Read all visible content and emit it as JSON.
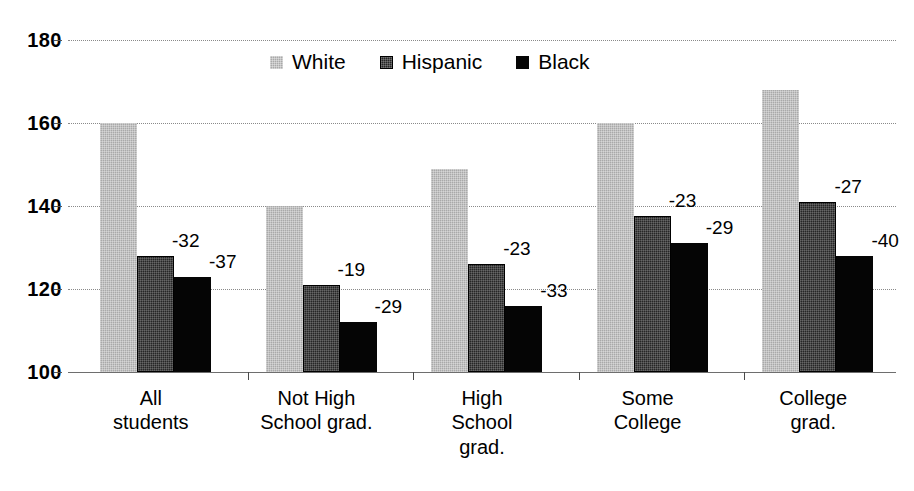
{
  "chart_data": {
    "type": "bar",
    "title": "",
    "subtitle": "",
    "xlabel": "",
    "ylabel": "",
    "ylim": [
      100,
      180
    ],
    "ytick_labels": [
      "100",
      "120",
      "140",
      "160",
      "180"
    ],
    "yticks": [
      100,
      120,
      140,
      160,
      180
    ],
    "grid": true,
    "legend_position": "top-center",
    "categories": [
      "All\nstudents",
      "Not High\nSchool grad.",
      "High\nSchool\ngrad.",
      "Some\nCollege",
      "College\ngrad."
    ],
    "category_lines": [
      [
        "All",
        "students"
      ],
      [
        "Not High",
        "School grad."
      ],
      [
        "High",
        "School",
        "grad."
      ],
      [
        "Some",
        "College"
      ],
      [
        "College",
        "grad."
      ]
    ],
    "series": [
      {
        "name": "White",
        "color": "#a9a9a9",
        "values": [
          160,
          140,
          149,
          160,
          168
        ],
        "labels": [
          "",
          "",
          "",
          "",
          ""
        ]
      },
      {
        "name": "Hispanic",
        "color": "#262626",
        "values": [
          128,
          121,
          126,
          137.5,
          141
        ],
        "labels": [
          "-32",
          "-19",
          "-23",
          "-23",
          "-27"
        ]
      },
      {
        "name": "Black",
        "color": "#050505",
        "values": [
          123,
          112,
          116,
          131,
          128
        ],
        "labels": [
          "-37",
          "-29",
          "-33",
          "-29",
          "-40"
        ]
      }
    ]
  },
  "legend": {
    "items": [
      {
        "label": "White",
        "swatch": "s-white"
      },
      {
        "label": "Hispanic",
        "swatch": "s-hispanic"
      },
      {
        "label": "Black",
        "swatch": "s-black"
      }
    ]
  },
  "axis": {
    "y_labels": [
      "180",
      "160",
      "140",
      "120",
      "100"
    ]
  }
}
